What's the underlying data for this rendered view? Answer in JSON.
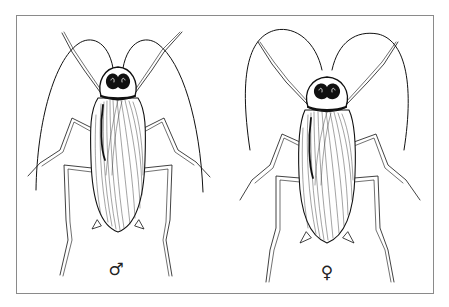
{
  "figure": {
    "type": "scientific-illustration",
    "border_color": "#8a8a8a",
    "ink_color": "#111111",
    "specimens": [
      {
        "id": "male",
        "symbol": "♂",
        "symbol_position": {
          "x": 116,
          "y": 269
        },
        "center_x": 117,
        "head_y": 78
      },
      {
        "id": "female",
        "symbol": "♀",
        "symbol_position": {
          "x": 327,
          "y": 272
        },
        "center_x": 327,
        "head_y": 88
      }
    ]
  }
}
